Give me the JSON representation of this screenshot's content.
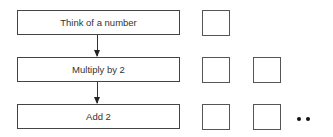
{
  "diagram": {
    "steps": [
      {
        "label": "Think of a number",
        "boxes": 1
      },
      {
        "label": "Multiply by 2",
        "boxes": 2
      },
      {
        "label": "Add 2",
        "boxes": 3,
        "continues": true
      }
    ],
    "connector": "arrow-down",
    "continuation": "••"
  }
}
